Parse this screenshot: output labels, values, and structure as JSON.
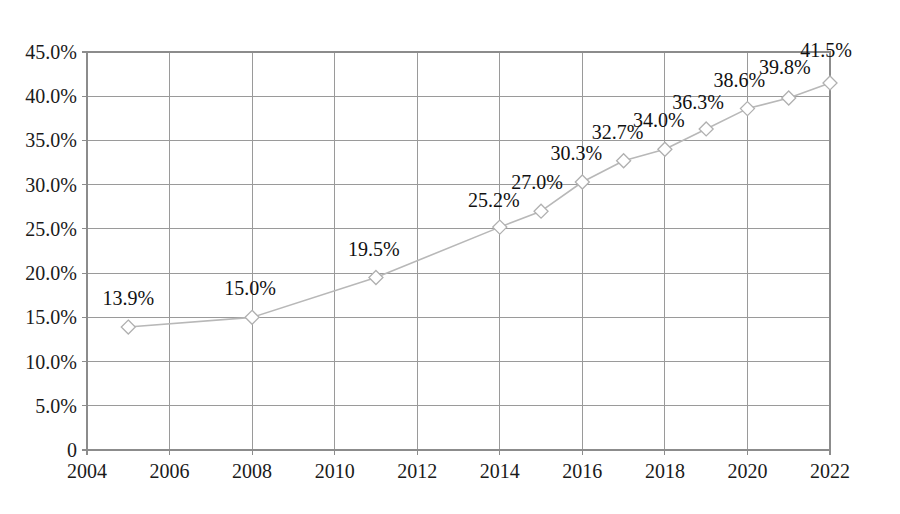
{
  "chart_data": {
    "type": "line",
    "title": "",
    "subtitle": "",
    "xlabel": "",
    "ylabel": "",
    "xlim": [
      2004,
      2022
    ],
    "ylim": [
      0,
      45
    ],
    "grid": true,
    "legend": null,
    "legend_position": "none",
    "marker": "open-diamond",
    "line_color": "#b8b8b8",
    "marker_color": "#b0b0b0",
    "grid_color": "#9a9a9a",
    "x": [
      2005,
      2008,
      2011,
      2014,
      2015,
      2016,
      2017,
      2018,
      2019,
      2020,
      2021,
      2022
    ],
    "values": [
      13.9,
      15.0,
      19.5,
      25.2,
      27.0,
      30.3,
      32.7,
      34.0,
      36.3,
      38.6,
      39.8,
      41.5
    ],
    "point_labels": [
      "13.9%",
      "15.0%",
      "19.5%",
      "25.2%",
      "27.0%",
      "30.3%",
      "32.7%",
      "34.0%",
      "36.3%",
      "38.6%",
      "39.8%",
      "41.5%"
    ],
    "y_ticks": [
      0,
      5,
      10,
      15,
      20,
      25,
      30,
      35,
      40,
      45
    ],
    "y_tick_labels": [
      "0",
      "5.0%",
      "10.0%",
      "15.0%",
      "20.0%",
      "25.0%",
      "30.0%",
      "35.0%",
      "40.0%",
      "45.0%"
    ],
    "x_ticks": [
      2004,
      2006,
      2008,
      2010,
      2012,
      2014,
      2016,
      2018,
      2020,
      2022
    ],
    "x_tick_labels": [
      "2004",
      "2006",
      "2008",
      "2010",
      "2012",
      "2014",
      "2016",
      "2018",
      "2020",
      "2022"
    ]
  }
}
